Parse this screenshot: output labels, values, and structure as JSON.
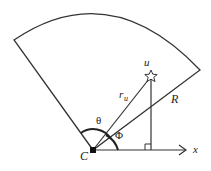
{
  "diagram": {
    "labels": {
      "center": "C",
      "x_axis": "x",
      "star": "u",
      "ru_main": "r",
      "ru_sub": "u",
      "radius": "R",
      "theta": "θ",
      "phi": "Φ"
    },
    "colors": {
      "stroke": "#333333",
      "background": "#ffffff"
    }
  }
}
